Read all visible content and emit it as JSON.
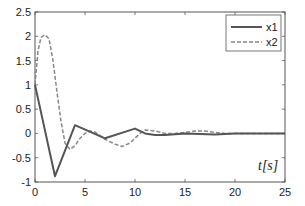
{
  "chart_data": {
    "type": "line",
    "title": "",
    "xlabel": "t[s]",
    "ylabel": "",
    "xlim": [
      0,
      25
    ],
    "ylim": [
      -1,
      2.5
    ],
    "xticks": [
      0,
      5,
      10,
      15,
      20,
      25
    ],
    "yticks": [
      -1,
      -0.5,
      0,
      0.5,
      1,
      1.5,
      2,
      2.5
    ],
    "xtick_labels": [
      "0",
      "5",
      "10",
      "15",
      "20",
      "25"
    ],
    "ytick_labels": [
      "-1",
      "-0.5",
      "0",
      "0.5",
      "1",
      "1.5",
      "2",
      "2.5"
    ],
    "grid": false,
    "legend_position": "upper right",
    "series": [
      {
        "name": "x1",
        "style": "solid",
        "color": "#555555",
        "x": [
          0,
          2,
          4,
          7,
          10,
          11,
          12,
          13,
          15,
          18,
          20,
          25
        ],
        "y": [
          1.0,
          -0.88,
          0.17,
          -0.1,
          0.1,
          0.0,
          -0.03,
          -0.03,
          0.0,
          -0.02,
          0.0,
          0.0
        ]
      },
      {
        "name": "x2",
        "style": "dashed",
        "color": "#888888",
        "x": [
          0,
          0.3,
          0.6,
          1.0,
          1.4,
          1.8,
          2.2,
          2.6,
          3.0,
          3.5,
          4.0,
          4.5,
          5.0,
          5.5,
          6.0,
          7.0,
          8.0,
          8.7,
          9.5,
          10.5,
          11.0,
          12.0,
          13.0,
          14.0,
          15.0,
          16.0,
          17.0,
          18.0,
          19.0,
          20.0,
          25.0
        ],
        "y": [
          1.0,
          1.7,
          1.98,
          2.03,
          1.95,
          1.5,
          0.85,
          0.25,
          -0.2,
          -0.33,
          -0.25,
          -0.1,
          0.0,
          0.05,
          0.03,
          -0.12,
          -0.22,
          -0.27,
          -0.2,
          0.0,
          0.07,
          0.05,
          0.0,
          0.0,
          0.02,
          0.05,
          0.05,
          0.02,
          0.0,
          0.0,
          0.0
        ]
      }
    ]
  },
  "legend": {
    "items": [
      {
        "label": "x1",
        "style": "solid"
      },
      {
        "label": "x2",
        "style": "dashed"
      }
    ]
  },
  "axis": {
    "xlabel": "t[s]"
  }
}
